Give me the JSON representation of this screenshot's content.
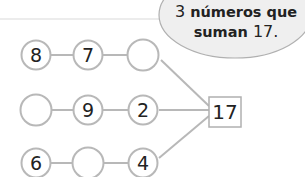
{
  "bubble": {
    "line1_num": "3",
    "line1_text": "números que",
    "line2_text": "suman",
    "line2_num": "17."
  },
  "target": {
    "value": "17"
  },
  "rows": [
    {
      "cells": [
        "8",
        "7",
        ""
      ]
    },
    {
      "cells": [
        "",
        "9",
        "2"
      ]
    },
    {
      "cells": [
        "6",
        "",
        "4"
      ]
    }
  ],
  "colors": {
    "stroke": "#b8b8b8",
    "text": "#222222",
    "bubble_fill": "#efefef"
  }
}
